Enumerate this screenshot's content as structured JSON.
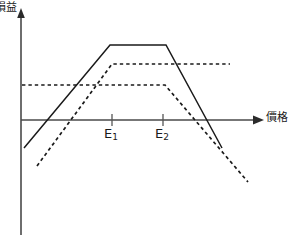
{
  "chart_data": {
    "type": "line",
    "title": "",
    "xlabel": "價格",
    "ylabel": "損益",
    "grid": false,
    "legend": null,
    "axis_origin_label": "0",
    "xticks": [
      {
        "label": "E1",
        "display": "E",
        "sub": "1",
        "x": 112
      },
      {
        "label": "E2",
        "display": "E",
        "sub": "2",
        "x": 163
      }
    ],
    "xlim": [
      21,
      262
    ],
    "ylim": [
      235,
      10
    ],
    "zero_line_y": 120,
    "series": [
      {
        "name": "combined-position",
        "style": "solid",
        "color": "#1a1a1a",
        "points": [
          [
            24,
            148
          ],
          [
            110,
            45
          ],
          [
            166,
            45
          ],
          [
            222,
            148
          ]
        ]
      },
      {
        "name": "option-position-upper",
        "style": "dashed",
        "color": "#1a1a1a",
        "points": [
          [
            37,
            166
          ],
          [
            112,
            64
          ],
          [
            230,
            64
          ]
        ]
      },
      {
        "name": "option-position-lower",
        "style": "dashed",
        "color": "#1a1a1a",
        "points": [
          [
            22,
            85
          ],
          [
            165,
            85
          ],
          [
            248,
            182
          ]
        ]
      }
    ],
    "axes": {
      "y_axis": {
        "x": 21,
        "y_top": 10,
        "y_bottom": 235,
        "arrow": "up"
      },
      "x_axis": {
        "y": 120,
        "x_left": 21,
        "x_right": 262,
        "arrow": "right"
      }
    }
  },
  "colors": {
    "background": "#ffffff",
    "ink": "#1a1a1a",
    "axis": "#3a3a3a"
  }
}
